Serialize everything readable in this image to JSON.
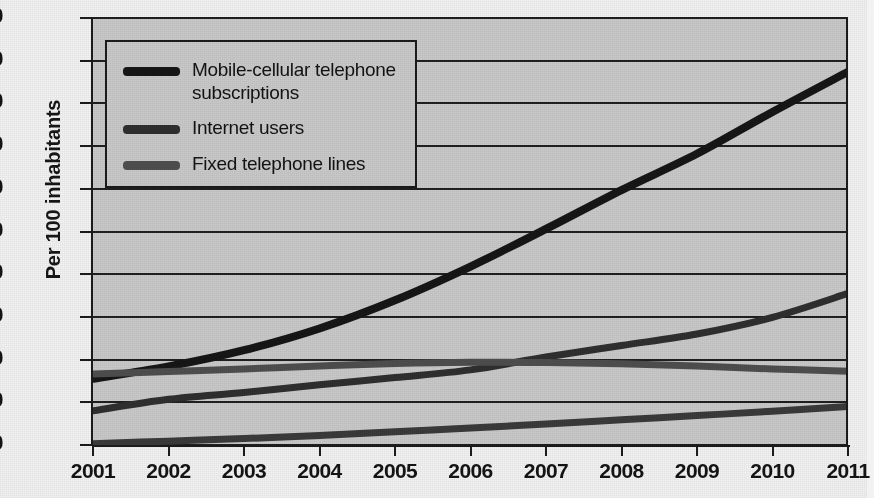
{
  "chart_data": {
    "type": "line",
    "title": "",
    "xlabel": "",
    "ylabel": "Per 100 inhabitants",
    "x": [
      2001,
      2002,
      2003,
      2004,
      2005,
      2006,
      2007,
      2008,
      2009,
      2010,
      2011
    ],
    "tick_labels": [
      "2001",
      "2002",
      "2003",
      "2004",
      "2005",
      "2006",
      "2007",
      "2008",
      "2009",
      "2010",
      "2011"
    ],
    "ylim": [
      0,
      100
    ],
    "yticks": [
      0,
      10,
      20,
      30,
      40,
      50,
      60,
      70,
      80,
      90,
      100
    ],
    "ytick_labels": [
      "0",
      "10",
      "20",
      "30",
      "40",
      "50",
      "60",
      "70",
      "80",
      "90",
      "100"
    ],
    "grid": true,
    "legend_position": "upper-left",
    "series": [
      {
        "name": "Mobile-cellular telephone subscriptions",
        "color": "#161616",
        "width": 8,
        "in_legend": true,
        "values": [
          15.5,
          18.4,
          22.2,
          27.3,
          33.9,
          41.8,
          50.6,
          59.7,
          68.2,
          78.0,
          87.4
        ]
      },
      {
        "name": "Internet users",
        "color": "#2f2f2f",
        "width": 7,
        "in_legend": true,
        "values": [
          8.0,
          10.7,
          12.3,
          14.1,
          15.8,
          17.6,
          20.6,
          23.3,
          26.0,
          29.9,
          35.5
        ]
      },
      {
        "name": "Fixed telephone lines",
        "color": "#4e4e4e",
        "width": 7,
        "in_legend": true,
        "values": [
          16.6,
          17.2,
          17.8,
          18.5,
          19.1,
          19.4,
          19.3,
          19.0,
          18.5,
          17.8,
          17.3
        ]
      },
      {
        "name": "low-series",
        "color": "#3a3a3a",
        "width": 7,
        "in_legend": false,
        "values": [
          0.3,
          0.9,
          1.5,
          2.2,
          3.1,
          4.0,
          4.9,
          5.9,
          6.9,
          7.9,
          9.0
        ]
      }
    ]
  },
  "legend": {
    "items": [
      {
        "label": "Mobile-cellular telephone subscriptions",
        "color": "#161616"
      },
      {
        "label": "Internet users",
        "color": "#2f2f2f"
      },
      {
        "label": "Fixed telephone lines",
        "color": "#4e4e4e"
      }
    ]
  },
  "axes": {
    "y_title": "Per 100 inhabitants"
  }
}
